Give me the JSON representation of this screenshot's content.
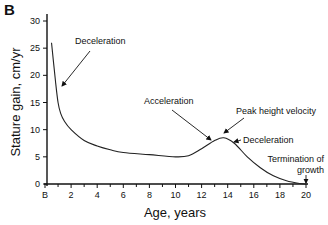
{
  "panel_label": "B",
  "chart_data": {
    "type": "line",
    "title": "",
    "xlabel": "Age, years",
    "ylabel": "Stature gain, cm/yr",
    "xlim": [
      0,
      20
    ],
    "ylim": [
      0,
      30
    ],
    "x_ticks": [
      "B",
      "2",
      "4",
      "6",
      "8",
      "10",
      "12",
      "14",
      "16",
      "18",
      "20"
    ],
    "y_ticks": [
      "0",
      "5",
      "10",
      "15",
      "20",
      "25",
      "30"
    ],
    "grid": false,
    "series": [
      {
        "name": "Stature gain velocity",
        "x": [
          0.5,
          0.8,
          1.0,
          1.2,
          1.5,
          2,
          3,
          4,
          5,
          6,
          8,
          10,
          11,
          12,
          13,
          13.7,
          14.5,
          15.5,
          16.5,
          17.5,
          18.5,
          19.5,
          20
        ],
        "y": [
          26,
          19,
          15,
          13,
          11.5,
          10,
          8,
          7,
          6.3,
          5.8,
          5.4,
          5.0,
          5.2,
          6.5,
          8.0,
          8.5,
          7.5,
          5.0,
          3.0,
          1.5,
          0.6,
          0.1,
          0
        ]
      }
    ],
    "annotations": [
      {
        "text": "Deceleration",
        "x": 1.0,
        "y": 18
      },
      {
        "text": "Acceleration",
        "x": 12.6,
        "y": 8
      },
      {
        "text": "Peak height velocity",
        "x": 13.7,
        "y": 8.5
      },
      {
        "text": "Deceleration",
        "x": 14.5,
        "y": 7.5
      },
      {
        "text": "Termination of growth",
        "x": 20,
        "y": 0
      }
    ]
  }
}
